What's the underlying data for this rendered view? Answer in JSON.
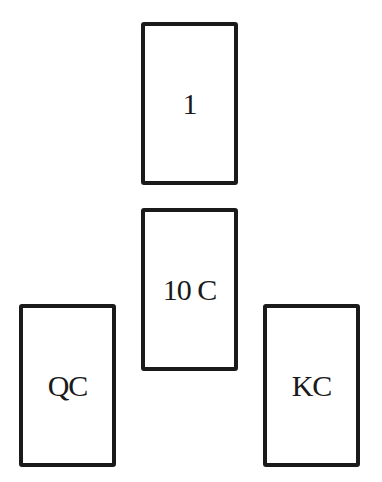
{
  "cards": [
    {
      "id": "top",
      "label": "1"
    },
    {
      "id": "middle",
      "label": "10 C"
    },
    {
      "id": "left",
      "label": "QC"
    },
    {
      "id": "right",
      "label": "KC"
    }
  ]
}
